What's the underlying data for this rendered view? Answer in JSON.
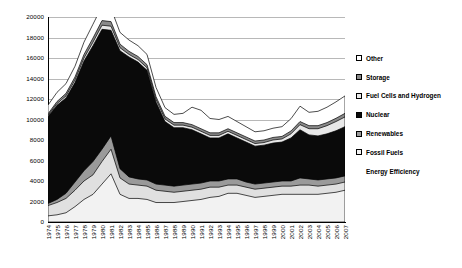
{
  "chart_data": {
    "type": "area",
    "stacked": true,
    "title": "",
    "xlabel": "",
    "ylabel": "",
    "ylim": [
      0,
      20000
    ],
    "ytick_step": 2000,
    "yticks": [
      0,
      2000,
      4000,
      6000,
      8000,
      10000,
      12000,
      14000,
      16000,
      18000,
      20000
    ],
    "grid": true,
    "legend_position": "right",
    "categories": [
      "1974",
      "1975",
      "1976",
      "1977",
      "1978",
      "1979",
      "1980",
      "1981",
      "1982",
      "1983",
      "1984",
      "1985",
      "1986",
      "1987",
      "1988",
      "1989",
      "1990",
      "1991",
      "1992",
      "1993",
      "1994",
      "1995",
      "1996",
      "1997",
      "1998",
      "1999",
      "2000",
      "2001",
      "2002",
      "2003",
      "2004",
      "2005",
      "2006",
      "2007"
    ],
    "series": [
      {
        "name": "Energy Efficiency",
        "color": "#f2f2f2",
        "values": [
          600,
          700,
          900,
          1500,
          2200,
          2700,
          3700,
          4700,
          2700,
          2300,
          2300,
          2200,
          1900,
          1900,
          1900,
          2000,
          2100,
          2200,
          2400,
          2500,
          2800,
          2800,
          2600,
          2400,
          2500,
          2600,
          2700,
          2700,
          2700,
          2700,
          2700,
          2800,
          2900,
          3100
        ]
      },
      {
        "name": "Fossil Fuels",
        "color": "#e0e0e0",
        "values": [
          1000,
          1200,
          1400,
          1600,
          1800,
          1900,
          2200,
          2400,
          1600,
          1400,
          1300,
          1300,
          1200,
          1100,
          1000,
          1000,
          1000,
          1000,
          1000,
          900,
          800,
          800,
          800,
          800,
          800,
          800,
          800,
          800,
          900,
          900,
          800,
          800,
          800,
          800
        ]
      },
      {
        "name": "Renewables",
        "color": "#9a9a9a",
        "values": [
          200,
          300,
          500,
          800,
          1000,
          1300,
          1200,
          1300,
          900,
          700,
          600,
          600,
          600,
          600,
          600,
          600,
          600,
          600,
          600,
          600,
          600,
          600,
          500,
          500,
          500,
          500,
          500,
          500,
          700,
          600,
          600,
          600,
          600,
          600
        ]
      },
      {
        "name": "Nuclear",
        "color": "#0a0a0a",
        "values": [
          8500,
          9200,
          9300,
          9700,
          10700,
          11300,
          11700,
          10300,
          11500,
          11700,
          11400,
          10700,
          8000,
          6200,
          5700,
          5600,
          5300,
          4800,
          4200,
          4200,
          4400,
          4000,
          3900,
          3700,
          3700,
          3800,
          3800,
          4200,
          4700,
          4300,
          4300,
          4400,
          4600,
          4800
        ]
      },
      {
        "name": "Fuel Cells and Hydrogen",
        "color": "#e8e8e8",
        "values": [
          100,
          150,
          200,
          250,
          300,
          350,
          400,
          400,
          300,
          250,
          250,
          250,
          250,
          250,
          250,
          250,
          250,
          250,
          250,
          250,
          250,
          250,
          250,
          250,
          250,
          300,
          300,
          400,
          500,
          600,
          700,
          800,
          900,
          950
        ]
      },
      {
        "name": "Storage",
        "color": "#8a8a8a",
        "values": [
          150,
          200,
          250,
          300,
          350,
          400,
          450,
          450,
          350,
          300,
          300,
          300,
          280,
          260,
          250,
          250,
          250,
          250,
          250,
          250,
          250,
          250,
          250,
          250,
          250,
          250,
          250,
          280,
          300,
          300,
          300,
          300,
          320,
          350
        ]
      },
      {
        "name": "Other",
        "color": "#ffffff",
        "values": [
          850,
          900,
          950,
          1050,
          1200,
          1350,
          1400,
          1300,
          1150,
          1100,
          1050,
          1000,
          900,
          850,
          800,
          900,
          1700,
          1800,
          1400,
          1300,
          1200,
          1100,
          1000,
          900,
          900,
          900,
          950,
          1200,
          1500,
          1300,
          1400,
          1500,
          1600,
          1700
        ]
      }
    ]
  },
  "legend": {
    "items": [
      {
        "label": "Other",
        "swatch": "white-square-swatch"
      },
      {
        "label": "Storage",
        "swatch": "dark-gray-square-swatch"
      },
      {
        "label": "Fuel Cells and Hydrogen",
        "swatch": "light-gray-square-swatch"
      },
      {
        "label": "Nuclear",
        "swatch": "black-square-swatch"
      },
      {
        "label": "Renewables",
        "swatch": "mid-gray-square-swatch"
      },
      {
        "label": "Fossil Fuels",
        "swatch": "pale-gray-square-swatch"
      },
      {
        "label": "Energy Efficiency",
        "swatch": "no-swatch"
      }
    ]
  }
}
